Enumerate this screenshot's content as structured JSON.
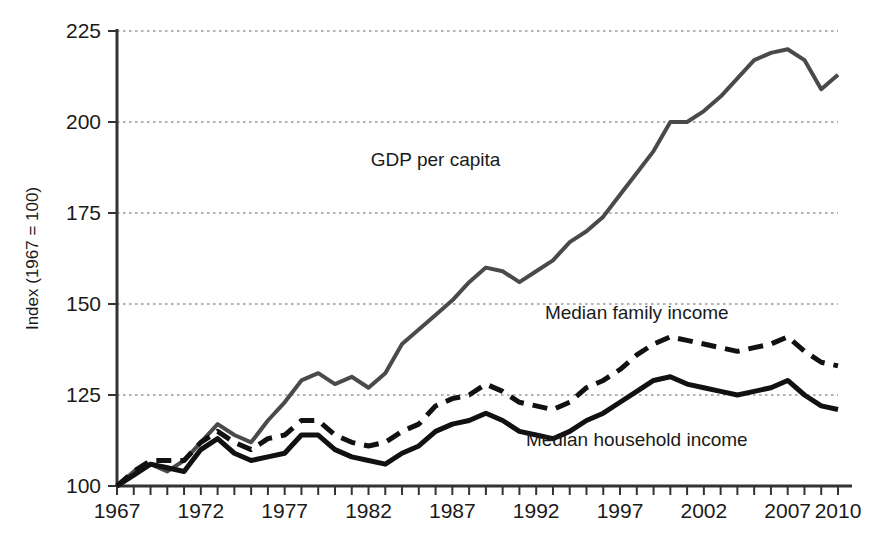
{
  "chart_data": {
    "type": "line",
    "title": "",
    "subtitle": "",
    "xlabel": "",
    "ylabel": "Index (1967 = 100)",
    "xlim": [
      1967,
      2010
    ],
    "ylim": [
      100,
      225
    ],
    "ytick_labels": [
      "100",
      "125",
      "150",
      "175",
      "200",
      "225"
    ],
    "yticks": [
      100,
      125,
      150,
      175,
      200,
      225
    ],
    "xtick_labels": [
      "1967",
      "1972",
      "1977",
      "1982",
      "1987",
      "1992",
      "1997",
      "2002",
      "2007",
      "2010"
    ],
    "xticks": [
      1967,
      1972,
      1977,
      1982,
      1987,
      1992,
      1997,
      2002,
      2007,
      2010
    ],
    "x_minor_tick_step": 1,
    "grid": "horizontal-dotted",
    "legend_position": "inline-annotations",
    "x": [
      1967,
      1968,
      1969,
      1970,
      1971,
      1972,
      1973,
      1974,
      1975,
      1976,
      1977,
      1978,
      1979,
      1980,
      1981,
      1982,
      1983,
      1984,
      1985,
      1986,
      1987,
      1988,
      1989,
      1990,
      1991,
      1992,
      1993,
      1994,
      1995,
      1996,
      1997,
      1998,
      1999,
      2000,
      2001,
      2002,
      2003,
      2004,
      2005,
      2006,
      2007,
      2008,
      2009,
      2010
    ],
    "series": [
      {
        "name": "GDP per capita",
        "style": "solid",
        "color": "#4a4a4a",
        "width": 4,
        "label_x": 1986,
        "label_y": 188,
        "values": [
          100,
          104,
          106,
          104,
          107,
          112,
          117,
          114,
          112,
          118,
          123,
          129,
          131,
          128,
          130,
          127,
          131,
          139,
          143,
          147,
          151,
          156,
          160,
          159,
          156,
          159,
          162,
          167,
          170,
          174,
          180,
          186,
          192,
          200,
          200,
          203,
          207,
          212,
          217,
          219,
          220,
          217,
          209,
          213
        ]
      },
      {
        "name": "Median family income",
        "style": "dashed",
        "color": "#111111",
        "width": 5,
        "label_x": 1998,
        "label_y": 146,
        "values": [
          100,
          104,
          107,
          107,
          107,
          112,
          115,
          112,
          110,
          113,
          114,
          118,
          118,
          114,
          112,
          111,
          112,
          115,
          117,
          122,
          124,
          125,
          128,
          126,
          123,
          122,
          121,
          123,
          127,
          129,
          132,
          136,
          139,
          141,
          140,
          139,
          138,
          137,
          138,
          139,
          141,
          137,
          134,
          133
        ]
      },
      {
        "name": "Median household income",
        "style": "solid",
        "color": "#111111",
        "width": 5,
        "label_x": 1998,
        "label_y": 111,
        "values": [
          100,
          103,
          106,
          105,
          104,
          110,
          113,
          109,
          107,
          108,
          109,
          114,
          114,
          110,
          108,
          107,
          106,
          109,
          111,
          115,
          117,
          118,
          120,
          118,
          115,
          114,
          113,
          115,
          118,
          120,
          123,
          126,
          129,
          130,
          128,
          127,
          126,
          125,
          126,
          127,
          129,
          125,
          122,
          121
        ]
      }
    ]
  },
  "annotations": {
    "gdp_label": "GDP per capita",
    "family_label": "Median family income",
    "household_label": "Median household income"
  },
  "colors": {
    "background": "#ffffff",
    "axis": "#333333",
    "grid": "#999999",
    "gdp_line": "#4a4a4a",
    "income_line": "#111111",
    "text": "#1a1a1a"
  }
}
